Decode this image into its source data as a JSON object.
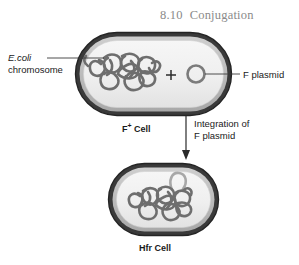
{
  "figure": {
    "number": "8.10",
    "title": "Conjugation"
  },
  "labels": {
    "ecoli_organism": "E.coli",
    "ecoli_structure": "chromosome",
    "f_plasmid": "F plasmid",
    "f_plus_cell_prefix": "F",
    "f_plus_cell_sup": "+",
    "f_plus_cell_suffix": " Cell",
    "integration_line1": "Integration of",
    "integration_line2": "F plasmid",
    "hfr_cell": "Hfr Cell",
    "plus_sign": "+"
  },
  "colors": {
    "title_gray": "#8a8a8a",
    "cell_outline": "#2b2b2b",
    "cell_inner_ring": "#b9b9b9",
    "cell_fill": "#efefef",
    "chromosome": "#6e6e6e",
    "plasmid": "#8c8c8c",
    "integrated_plasmid": "#a6a6a6",
    "leader_line": "#3a3a3a",
    "text": "#1a1a1a",
    "background": "#ffffff"
  },
  "diagram": {
    "type": "biology-process-diagram",
    "steps": [
      {
        "name": "F+ Cell",
        "contains": [
          "E.coli chromosome",
          "F plasmid"
        ]
      },
      {
        "name": "Integration of F plasmid",
        "kind": "transition-arrow"
      },
      {
        "name": "Hfr Cell",
        "contains": [
          "E.coli chromosome with integrated F plasmid"
        ]
      }
    ]
  }
}
